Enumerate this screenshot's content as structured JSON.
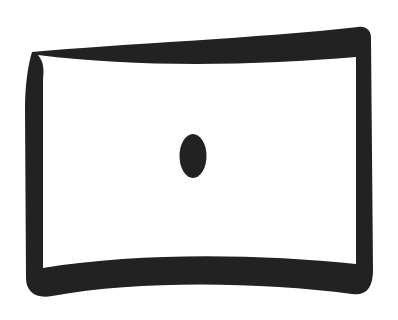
{
  "icon": {
    "name": "panorama-screen-icon",
    "stroke_color": "#222222",
    "background_color": "#ffffff"
  }
}
